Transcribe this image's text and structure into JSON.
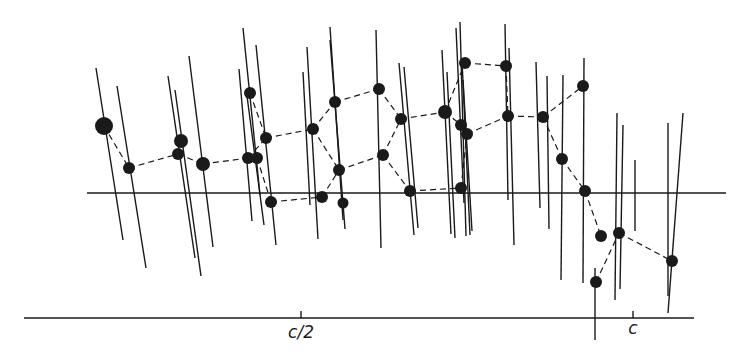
{
  "diagram": {
    "type": "crystal-structure-projection",
    "colors": {
      "ink": "#1a1a1a",
      "background": "#ffffff"
    },
    "reference_line": {
      "x1": 87,
      "y1": 193,
      "x2": 726,
      "y2": 193
    },
    "axis": {
      "line": {
        "x1": 24,
        "y1": 318,
        "x2": 694,
        "y2": 318
      },
      "ticks": [
        {
          "x": 301,
          "label": "c/2"
        },
        {
          "x": 633,
          "label": "c"
        }
      ]
    },
    "rods": [
      [
        96,
        68,
        123,
        240
      ],
      [
        117,
        86,
        146,
        268
      ],
      [
        168,
        76,
        195,
        258
      ],
      [
        175,
        90,
        201,
        276
      ],
      [
        189,
        56,
        213,
        247
      ],
      [
        239,
        69,
        252,
        221
      ],
      [
        243,
        28,
        260,
        195
      ],
      [
        256,
        45,
        276,
        245
      ],
      [
        247,
        96,
        264,
        225
      ],
      [
        307,
        47,
        318,
        239
      ],
      [
        303,
        72,
        310,
        205
      ],
      [
        330,
        27,
        343,
        220
      ],
      [
        330,
        40,
        345,
        229
      ],
      [
        376,
        30,
        381,
        248
      ],
      [
        399,
        63,
        414,
        235
      ],
      [
        404,
        67,
        418,
        228
      ],
      [
        442,
        50,
        451,
        234
      ],
      [
        447,
        72,
        455,
        238
      ],
      [
        456,
        28,
        464,
        203
      ],
      [
        460,
        22,
        466,
        236
      ],
      [
        462,
        60,
        470,
        235
      ],
      [
        463,
        80,
        472,
        231
      ],
      [
        505,
        24,
        508,
        200
      ],
      [
        509,
        48,
        514,
        245
      ],
      [
        536,
        62,
        540,
        208
      ],
      [
        547,
        76,
        549,
        229
      ],
      [
        563,
        75,
        561,
        280
      ],
      [
        584,
        58,
        583,
        283
      ],
      [
        595,
        268,
        595,
        340
      ],
      [
        617,
        113,
        615,
        300
      ],
      [
        623,
        125,
        620,
        289
      ],
      [
        668,
        123,
        668,
        296
      ],
      [
        683,
        113,
        668,
        313
      ],
      [
        635,
        160,
        635,
        231
      ]
    ],
    "atoms": [
      {
        "x": 104,
        "y": 126,
        "r": 9
      },
      {
        "x": 129,
        "y": 168,
        "r": 6
      },
      {
        "x": 181,
        "y": 141,
        "r": 7
      },
      {
        "x": 178,
        "y": 154,
        "r": 6
      },
      {
        "x": 203,
        "y": 164,
        "r": 7
      },
      {
        "x": 250,
        "y": 93,
        "r": 6
      },
      {
        "x": 248,
        "y": 158,
        "r": 6
      },
      {
        "x": 257,
        "y": 158,
        "r": 6
      },
      {
        "x": 266,
        "y": 138,
        "r": 6
      },
      {
        "x": 271,
        "y": 202,
        "r": 6
      },
      {
        "x": 313,
        "y": 129,
        "r": 6
      },
      {
        "x": 322,
        "y": 197,
        "r": 6
      },
      {
        "x": 343,
        "y": 203,
        "r": 5.5
      },
      {
        "x": 335,
        "y": 102,
        "r": 6
      },
      {
        "x": 339,
        "y": 170,
        "r": 6
      },
      {
        "x": 379,
        "y": 89,
        "r": 6
      },
      {
        "x": 383,
        "y": 155,
        "r": 6
      },
      {
        "x": 401,
        "y": 119,
        "r": 6
      },
      {
        "x": 410,
        "y": 191,
        "r": 6
      },
      {
        "x": 445,
        "y": 112,
        "r": 7
      },
      {
        "x": 461,
        "y": 125,
        "r": 6
      },
      {
        "x": 467,
        "y": 134,
        "r": 6
      },
      {
        "x": 461,
        "y": 188,
        "r": 6
      },
      {
        "x": 465,
        "y": 63,
        "r": 6
      },
      {
        "x": 506,
        "y": 66,
        "r": 6
      },
      {
        "x": 508,
        "y": 116,
        "r": 6
      },
      {
        "x": 543,
        "y": 117,
        "r": 6
      },
      {
        "x": 583,
        "y": 86,
        "r": 6
      },
      {
        "x": 562,
        "y": 159,
        "r": 6
      },
      {
        "x": 585,
        "y": 191,
        "r": 6
      },
      {
        "x": 601,
        "y": 236,
        "r": 6
      },
      {
        "x": 619,
        "y": 233,
        "r": 6
      },
      {
        "x": 596,
        "y": 282,
        "r": 6
      },
      {
        "x": 672,
        "y": 261,
        "r": 6
      }
    ],
    "bonds": [
      [
        104,
        126,
        129,
        168
      ],
      [
        129,
        168,
        178,
        154
      ],
      [
        178,
        154,
        203,
        164
      ],
      [
        203,
        164,
        248,
        158
      ],
      [
        250,
        93,
        266,
        138
      ],
      [
        248,
        158,
        266,
        138
      ],
      [
        257,
        158,
        271,
        202
      ],
      [
        266,
        138,
        313,
        129
      ],
      [
        271,
        202,
        322,
        197
      ],
      [
        313,
        129,
        335,
        102
      ],
      [
        313,
        129,
        339,
        170
      ],
      [
        322,
        197,
        339,
        170
      ],
      [
        335,
        102,
        379,
        89
      ],
      [
        339,
        170,
        383,
        155
      ],
      [
        379,
        89,
        401,
        119
      ],
      [
        383,
        155,
        401,
        119
      ],
      [
        383,
        155,
        410,
        191
      ],
      [
        401,
        119,
        445,
        112
      ],
      [
        410,
        191,
        461,
        188
      ],
      [
        445,
        112,
        465,
        63
      ],
      [
        445,
        112,
        461,
        125
      ],
      [
        467,
        134,
        508,
        116
      ],
      [
        461,
        188,
        467,
        134
      ],
      [
        465,
        63,
        506,
        66
      ],
      [
        506,
        66,
        508,
        116
      ],
      [
        508,
        116,
        543,
        117
      ],
      [
        543,
        117,
        583,
        86
      ],
      [
        543,
        117,
        562,
        159
      ],
      [
        562,
        159,
        585,
        191
      ],
      [
        585,
        191,
        601,
        236
      ],
      [
        596,
        282,
        619,
        233
      ],
      [
        619,
        233,
        672,
        261
      ]
    ]
  }
}
